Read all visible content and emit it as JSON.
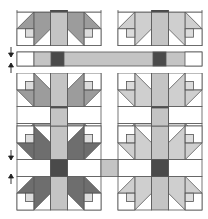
{
  "diagram": {
    "type": "quilt-assembly",
    "colors": {
      "background": "#ffffff",
      "outline": "#555555",
      "paw_dark": "#6e6e6e",
      "paw_medium": "#9c9c9c",
      "paw_light": "#cfcfcf",
      "sashing": "#c4c4c4",
      "cornerstone": "#4a4a4a",
      "small_square": "#dcdcdc"
    },
    "arrows": [
      {
        "direction": "down",
        "label": "down-arrow"
      },
      {
        "direction": "up",
        "label": "up-arrow"
      }
    ],
    "rows": [
      {
        "name": "top-block-row-partial",
        "blocks": [
          "medium",
          "light"
        ]
      },
      {
        "name": "sashing-row",
        "cornerstones": 2
      },
      {
        "name": "middle-block-row",
        "blocks": [
          "medium",
          "light"
        ]
      },
      {
        "name": "bottom-block-row",
        "blocks": [
          "dark",
          "light"
        ]
      }
    ]
  }
}
